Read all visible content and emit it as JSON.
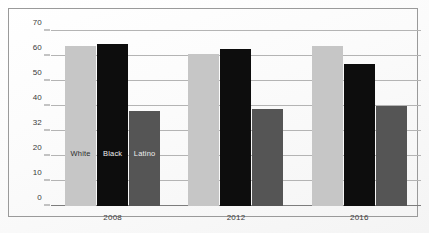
{
  "chart_data": {
    "type": "bar",
    "title": "",
    "subtitle": "",
    "xlabel": "",
    "ylabel": "",
    "categories": [
      "2008",
      "2012",
      "2016"
    ],
    "series": [
      {
        "name": "White",
        "color": "#c6c6c6",
        "values": [
          64,
          61,
          64
        ]
      },
      {
        "name": "Black",
        "color": "#0d0d0d",
        "values": [
          65,
          63,
          57
        ]
      },
      {
        "name": "Latino",
        "color": "#555555",
        "values": [
          38,
          39,
          40
        ]
      }
    ],
    "ylim": [
      0,
      70
    ],
    "yticks": [
      "0",
      "10",
      "20",
      "32",
      "40",
      "50",
      "60",
      "70"
    ],
    "ytick_values": [
      0,
      10,
      20,
      30,
      40,
      50,
      60,
      70
    ],
    "grid": true,
    "legend_position": "in-bars-first-group",
    "annotations": []
  },
  "frame": {
    "border_color": "#9a9a9a",
    "background": "#fdfdfd"
  }
}
